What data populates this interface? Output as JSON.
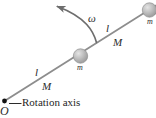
{
  "figure": {
    "width": 156,
    "height": 118,
    "background_color": "#ffffff",
    "caption": "Rotation axis",
    "pivot_label": "O",
    "angular_velocity_label": "ω",
    "rod": {
      "color": "#8a8a8a",
      "segments": [
        {
          "length_label": "l",
          "mass_label": "M"
        },
        {
          "length_label": "l",
          "mass_label": "M"
        }
      ]
    },
    "spheres": [
      {
        "mass_label": "m",
        "fill_color": "#b9b9b9"
      },
      {
        "mass_label": "m",
        "fill_color": "#b9b9b9"
      }
    ],
    "labels": {
      "lower_length": "l",
      "lower_mass": "M",
      "upper_length": "l",
      "upper_mass": "M",
      "middle_sphere_mass": "m",
      "outer_sphere_mass": "m"
    }
  }
}
